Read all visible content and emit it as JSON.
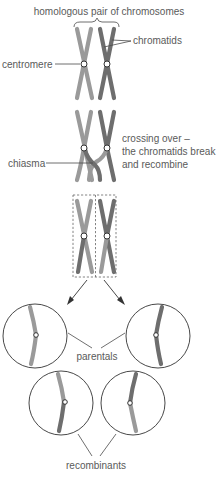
{
  "diagram": {
    "title": "homologous pair of chromosomes",
    "labels": {
      "chromatids": "chromatids",
      "centromere": "centromere",
      "crossing_over_line1": "crossing over –",
      "crossing_over_line2": "the chromatids break",
      "crossing_over_line3": "and recombine",
      "chiasma": "chiasma",
      "parentals": "parentals",
      "recombinants": "recombinants"
    },
    "stages": [
      "homologous pair",
      "crossing over",
      "recombined pair separated",
      "parental cells",
      "recombinant cells"
    ],
    "colors": {
      "light_chromosome": "#9a9a9a",
      "dark_chromosome": "#6e6e6e",
      "outline": "#333333",
      "label_text": "#5a5a5a",
      "background": "#ffffff"
    }
  }
}
